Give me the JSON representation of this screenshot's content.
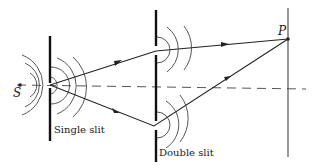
{
  "diagram": {
    "labels": {
      "source": "S",
      "point": "P",
      "single_slit": "Single slit",
      "double_slit": "Double slit"
    },
    "elements": {
      "source": "point-source",
      "barrier_1": "single-slit-barrier",
      "barrier_2": "double-slit-barrier",
      "screen": "observation-screen",
      "axis": "dashed-central-axis",
      "rays": [
        "upper-ray",
        "lower-ray"
      ]
    },
    "colors": {
      "ink": "#222222",
      "wave": "#555555",
      "background": "#ffffff"
    }
  }
}
